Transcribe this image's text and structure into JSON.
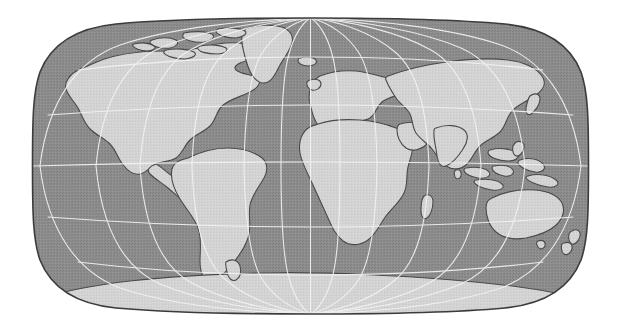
{
  "figure": {
    "kind": "world-map",
    "title": "World Map",
    "caption": "Grayscale world map in a pseudocylindrical (Eckert/Robinson-style) projection with a 30-degree graticule",
    "width_px": 621,
    "height_px": 334
  },
  "map": {
    "projection": "Eckert III (pseudocylindrical, rounded outline)",
    "center_meridian_label": "0",
    "bounds_px": {
      "left": 33,
      "top": 18,
      "right": 588,
      "bottom": 314
    },
    "background_color": "#ffffff",
    "ocean_color": "#8d8d8d",
    "ocean_texture_color": "#7a7a7a",
    "land_color": "#d3d3d3",
    "land_shade_color": "#c6c6c6",
    "coastline_color": "#4a4a4a",
    "frame_color": "#3c3c3c",
    "graticule_color": "#f2f2f2",
    "graticule_width_px": 1.1
  },
  "graticule": {
    "meridian_interval_deg": 30,
    "parallel_interval_deg": 30,
    "meridians_deg": [
      -180,
      -150,
      -120,
      -90,
      -60,
      -30,
      0,
      30,
      60,
      90,
      120,
      150,
      180
    ],
    "parallels_deg": [
      -60,
      -30,
      0,
      30,
      60
    ],
    "equator_deg": 0,
    "shown": true
  },
  "landmasses": [
    {
      "name": "North America",
      "label": "north-america"
    },
    {
      "name": "Greenland",
      "label": "greenland"
    },
    {
      "name": "Canadian Arctic Archipelago",
      "label": "arctic-archipelago"
    },
    {
      "name": "South America",
      "label": "south-america"
    },
    {
      "name": "Africa",
      "label": "africa"
    },
    {
      "name": "Madagascar",
      "label": "madagascar"
    },
    {
      "name": "Europe",
      "label": "europe"
    },
    {
      "name": "British Isles",
      "label": "british-isles"
    },
    {
      "name": "Iceland",
      "label": "iceland"
    },
    {
      "name": "Asia",
      "label": "asia"
    },
    {
      "name": "Japan",
      "label": "japan"
    },
    {
      "name": "Indonesia",
      "label": "indonesia"
    },
    {
      "name": "Philippines",
      "label": "philippines"
    },
    {
      "name": "Australia",
      "label": "australia"
    },
    {
      "name": "New Zealand",
      "label": "new-zealand"
    },
    {
      "name": "Antarctica",
      "label": "antarctica"
    },
    {
      "name": "Sri Lanka",
      "label": "sri-lanka"
    },
    {
      "name": "New Guinea",
      "label": "new-guinea"
    }
  ]
}
